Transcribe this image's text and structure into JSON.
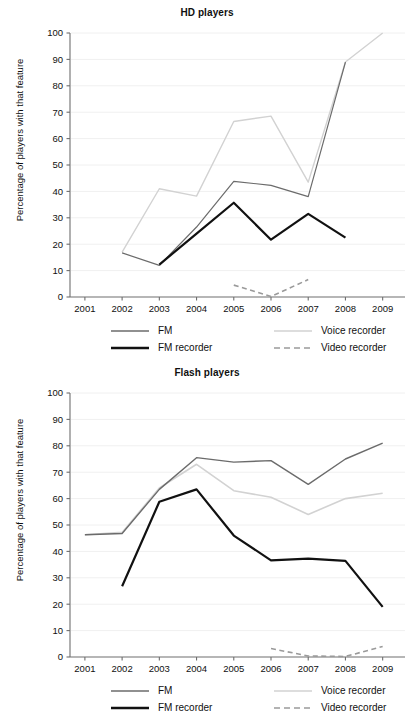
{
  "figure": {
    "ylabel": "Percentage of players with that feature",
    "y_ticks": [
      "0",
      "10",
      "20",
      "30",
      "40",
      "50",
      "60",
      "70",
      "80",
      "90",
      "100"
    ],
    "x_ticks": [
      "2001",
      "2002",
      "2003",
      "2004",
      "2005",
      "2006",
      "2007",
      "2008",
      "2009"
    ],
    "colors": {
      "fm": "#6b6b6b",
      "fm_recorder": "#111111",
      "voice_recorder": "#d2d2d2",
      "video_recorder": "#9a9a9a",
      "grid": "#f0f0f0",
      "axis": "#6e6e6e"
    },
    "legend": {
      "fm": "FM",
      "fm_recorder": "FM recorder",
      "voice_recorder": "Voice recorder",
      "video_recorder": "Video recorder"
    }
  },
  "chart_data": [
    {
      "type": "line",
      "title": "HD players",
      "xlabel": "",
      "ylabel": "Percentage of players with that feature",
      "x": [
        2001,
        2002,
        2003,
        2004,
        2005,
        2006,
        2007,
        2008,
        2009
      ],
      "xlim": [
        2000.6,
        2009.6
      ],
      "ylim": [
        0,
        100
      ],
      "ytick_step": 10,
      "grid": true,
      "legend_position": "below",
      "series": [
        {
          "name": "FM",
          "color": "#6b6b6b",
          "style": "solid",
          "width": 1.2,
          "points": [
            {
              "x": 2002,
              "y": 16.7
            },
            {
              "x": 2003,
              "y": 12.0
            },
            {
              "x": 2004,
              "y": 26.5
            },
            {
              "x": 2005,
              "y": 43.8
            },
            {
              "x": 2006,
              "y": 42.3
            },
            {
              "x": 2007,
              "y": 38.0
            },
            {
              "x": 2008,
              "y": 89.0
            }
          ]
        },
        {
          "name": "FM recorder",
          "color": "#111111",
          "style": "solid",
          "width": 2.2,
          "points": [
            {
              "x": 2003,
              "y": 12.3
            },
            {
              "x": 2004,
              "y": 24.0
            },
            {
              "x": 2005,
              "y": 35.7
            },
            {
              "x": 2006,
              "y": 21.7
            },
            {
              "x": 2007,
              "y": 31.5
            },
            {
              "x": 2008,
              "y": 22.5
            }
          ]
        },
        {
          "name": "Voice recorder",
          "color": "#d2d2d2",
          "style": "solid",
          "width": 1.4,
          "points": [
            {
              "x": 2002,
              "y": 17.0
            },
            {
              "x": 2003,
              "y": 41.0
            },
            {
              "x": 2004,
              "y": 38.2
            },
            {
              "x": 2005,
              "y": 66.5
            },
            {
              "x": 2006,
              "y": 68.5
            },
            {
              "x": 2007,
              "y": 43.5
            },
            {
              "x": 2008,
              "y": 89.0
            },
            {
              "x": 2009,
              "y": 100.0
            }
          ]
        },
        {
          "name": "Video recorder",
          "color": "#9a9a9a",
          "style": "dashed",
          "width": 1.6,
          "points": [
            {
              "x": 2005,
              "y": 4.5
            },
            {
              "x": 2006,
              "y": 0.2
            },
            {
              "x": 2007,
              "y": 6.6
            }
          ]
        }
      ]
    },
    {
      "type": "line",
      "title": "Flash players",
      "xlabel": "",
      "ylabel": "Percentage of players with that feature",
      "x": [
        2001,
        2002,
        2003,
        2004,
        2005,
        2006,
        2007,
        2008,
        2009
      ],
      "xlim": [
        2000.6,
        2009.6
      ],
      "ylim": [
        0,
        100
      ],
      "ytick_step": 10,
      "grid": true,
      "legend_position": "below",
      "series": [
        {
          "name": "FM",
          "color": "#6b6b6b",
          "style": "solid",
          "width": 1.4,
          "points": [
            {
              "x": 2001,
              "y": 46.3
            },
            {
              "x": 2002,
              "y": 46.8
            },
            {
              "x": 2003,
              "y": 63.5
            },
            {
              "x": 2004,
              "y": 75.5
            },
            {
              "x": 2005,
              "y": 73.8
            },
            {
              "x": 2006,
              "y": 74.4
            },
            {
              "x": 2007,
              "y": 65.4
            },
            {
              "x": 2008,
              "y": 75.0
            },
            {
              "x": 2009,
              "y": 81.0
            }
          ]
        },
        {
          "name": "FM recorder",
          "color": "#111111",
          "style": "solid",
          "width": 2.2,
          "points": [
            {
              "x": 2002,
              "y": 26.8
            },
            {
              "x": 2003,
              "y": 58.8
            },
            {
              "x": 2004,
              "y": 63.5
            },
            {
              "x": 2005,
              "y": 46.0
            },
            {
              "x": 2006,
              "y": 36.6
            },
            {
              "x": 2007,
              "y": 37.3
            },
            {
              "x": 2008,
              "y": 36.4
            },
            {
              "x": 2009,
              "y": 19.0
            }
          ]
        },
        {
          "name": "Voice recorder",
          "color": "#d2d2d2",
          "style": "solid",
          "width": 1.6,
          "points": [
            {
              "x": 2001,
              "y": 46.3
            },
            {
              "x": 2002,
              "y": 47.2
            },
            {
              "x": 2003,
              "y": 64.0
            },
            {
              "x": 2004,
              "y": 73.0
            },
            {
              "x": 2005,
              "y": 63.0
            },
            {
              "x": 2006,
              "y": 60.5
            },
            {
              "x": 2007,
              "y": 54.0
            },
            {
              "x": 2008,
              "y": 60.0
            },
            {
              "x": 2009,
              "y": 62.0
            }
          ]
        },
        {
          "name": "Video recorder",
          "color": "#9a9a9a",
          "style": "dashed",
          "width": 1.6,
          "points": [
            {
              "x": 2006,
              "y": 3.2
            },
            {
              "x": 2007,
              "y": 0.4
            },
            {
              "x": 2008,
              "y": 0.2
            },
            {
              "x": 2009,
              "y": 4.0
            }
          ]
        }
      ]
    }
  ]
}
